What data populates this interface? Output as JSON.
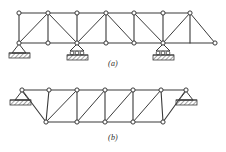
{
  "figure": {
    "type": "engineering-diagram",
    "background_color": "#ffffff",
    "line_color": "#3a3a3a",
    "joint_fill": "#ffffff",
    "hatch_color": "#555555",
    "panels": [
      {
        "id": "a",
        "caption": "(a)",
        "description": "continuous Pratt-type truss on three supports with overhang",
        "top_chord": {
          "y": 13,
          "x_start": 19,
          "x_end": 190
        },
        "bottom_chord": {
          "y": 43,
          "x_start": 19,
          "x_end": 215
        },
        "joints_top_x": [
          19,
          48,
          77,
          106,
          134,
          163,
          190
        ],
        "joints_bottom_x": [
          19,
          48,
          77,
          106,
          134,
          163,
          215
        ],
        "verticals_x": [
          19,
          48,
          77,
          106,
          134,
          163,
          190
        ],
        "diagonals": [
          {
            "from": "bottom-19",
            "to": "top-48"
          },
          {
            "from": "bottom-77",
            "to": "top-48"
          },
          {
            "from": "bottom-77",
            "to": "top-106"
          },
          {
            "from": "bottom-134",
            "to": "top-106"
          },
          {
            "from": "bottom-163",
            "to": "top-134"
          },
          {
            "from": "bottom-163",
            "to": "top-190"
          },
          {
            "from": "top-190",
            "to": "bottom-215"
          }
        ],
        "supports": [
          {
            "kind": "pin",
            "x": 19,
            "y": 43,
            "label": "pin-support"
          },
          {
            "kind": "roller",
            "x": 77,
            "y": 43,
            "label": "roller-support"
          },
          {
            "kind": "roller",
            "x": 163,
            "y": 43,
            "label": "roller-support"
          }
        ]
      },
      {
        "id": "b",
        "caption": "(b)",
        "description": "simply supported trapezoidal truss with inclined end posts",
        "top_chord": {
          "y": 90,
          "x_start": 22,
          "x_end": 186
        },
        "bottom_chord": {
          "y": 122,
          "x_start": 46,
          "x_end": 163
        },
        "joints_top_x": [
          22,
          49,
          77,
          105,
          133,
          161,
          186
        ],
        "joints_bottom_x": [
          46,
          77,
          105,
          133,
          163
        ],
        "verticals": [
          {
            "x": 49,
            "top_y": 90,
            "bottom_y": 122
          },
          {
            "x": 77,
            "top_y": 90,
            "bottom_y": 122
          },
          {
            "x": 105,
            "top_y": 90,
            "bottom_y": 122
          },
          {
            "x": 133,
            "top_y": 90,
            "bottom_y": 122
          },
          {
            "x": 161,
            "top_y": 90,
            "bottom_y": 122
          }
        ],
        "end_posts": [
          {
            "from": "top-22",
            "to": "bottom-46"
          },
          {
            "from": "top-186",
            "to": "bottom-163"
          }
        ],
        "diagonals": [
          {
            "from": "top-22",
            "to": "bottom-46"
          },
          {
            "from": "bottom-46",
            "to": "top-77"
          },
          {
            "from": "bottom-77",
            "to": "top-105"
          },
          {
            "from": "bottom-105",
            "to": "top-133"
          },
          {
            "from": "bottom-133",
            "to": "top-161"
          }
        ],
        "supports": [
          {
            "kind": "pin",
            "x": 22,
            "y": 90,
            "label": "pin-support"
          },
          {
            "kind": "roller",
            "x": 186,
            "y": 90,
            "label": "roller-support"
          }
        ]
      }
    ]
  }
}
